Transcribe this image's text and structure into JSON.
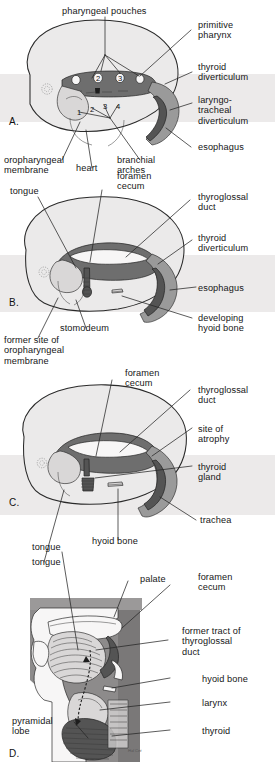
{
  "figure": {
    "type": "four-panel embryology diagram"
  },
  "panels": [
    {
      "id": "A",
      "marker": "A.",
      "labels": [
        {
          "name": "pharyngeal-pouches",
          "text": "pharyngeal pouches"
        },
        {
          "name": "primitive-pharynx",
          "text": "primitive\npharynx"
        },
        {
          "name": "thyroid-diverticulum",
          "text": "thyroid\ndiverticulum"
        },
        {
          "name": "laryngotracheal-diverticulum",
          "text": "laryngo-\ntracheal\ndiverticulum"
        },
        {
          "name": "esophagus",
          "text": "esophagus"
        },
        {
          "name": "oropharyngeal-membrane",
          "text": "oropharyngeal\nmembrane"
        },
        {
          "name": "heart",
          "text": "heart"
        },
        {
          "name": "branchial-arches",
          "text": "branchial\narches"
        }
      ],
      "pouch_numbers": [
        "1",
        "2",
        "3",
        "4"
      ],
      "arch_numbers": [
        "1",
        "2",
        "3",
        "4"
      ]
    },
    {
      "id": "B",
      "marker": "B.",
      "labels": [
        {
          "name": "foramen-cecum",
          "text": "foramen\ncecum"
        },
        {
          "name": "tongue",
          "text": "tongue"
        },
        {
          "name": "thyroglossal-duct",
          "text": "thyroglossal\nduct"
        },
        {
          "name": "thyroid-diverticulum",
          "text": "thyroid\ndiverticulum"
        },
        {
          "name": "esophagus",
          "text": "esophagus"
        },
        {
          "name": "developing-hyoid-bone",
          "text": "developing\nhyoid bone"
        },
        {
          "name": "stomodeum",
          "text": "stomodeum"
        },
        {
          "name": "former-site-of-oropharyngeal-membrane",
          "text": "former site of\noropharyngeal\nmembrane"
        }
      ]
    },
    {
      "id": "C",
      "marker": "C.",
      "labels": [
        {
          "name": "foramen-cecum",
          "text": "foramen\ncecum"
        },
        {
          "name": "thyroglossal-duct",
          "text": "thyroglossal\nduct"
        },
        {
          "name": "site-of-atrophy",
          "text": "site of\natrophy"
        },
        {
          "name": "thyroid-gland",
          "text": "thyroid\ngland"
        },
        {
          "name": "trachea",
          "text": "trachea"
        },
        {
          "name": "hyoid-bone",
          "text": "hyoid bone"
        },
        {
          "name": "tongue",
          "text": "tongue"
        }
      ]
    },
    {
      "id": "D",
      "marker": "D.",
      "labels": [
        {
          "name": "palate",
          "text": "palate"
        },
        {
          "name": "foramen-cecum",
          "text": "foramen\ncecum"
        },
        {
          "name": "former-tract-of-thyroglossal-duct",
          "text": "former tract of\nthyroglossal\nduct"
        },
        {
          "name": "hyoid-bone",
          "text": "hyoid bone"
        },
        {
          "name": "larynx",
          "text": "larynx"
        },
        {
          "name": "thyroid",
          "text": "thyroid"
        },
        {
          "name": "pyramidal-lobe",
          "text": "pyramidal\nlobe"
        },
        {
          "name": "tongue",
          "text": "tongue"
        }
      ],
      "artist_signature": "Hal Cet"
    }
  ],
  "colors": {
    "ink": "#1b1b1b",
    "outline": "#2a2a2a",
    "embryo_fill": "#ebeaea",
    "dark_tissue": "#545454",
    "mid_tissue": "#9a9a9a",
    "light_tissue": "#d9d7d7",
    "background": "#ffffff"
  }
}
